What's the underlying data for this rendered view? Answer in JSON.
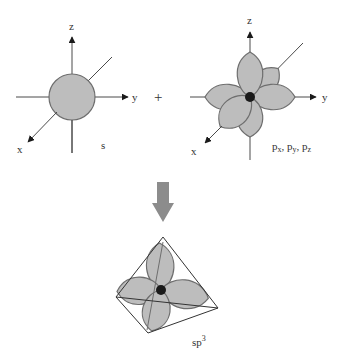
{
  "colors": {
    "orbital_fill": "#bdbdbd",
    "orbital_stroke": "#6e6e6e",
    "axis": "#4a4a4a",
    "nucleus": "#1a1a1a",
    "arrow_fill": "#8c8c8c",
    "tetra_stroke": "#333333"
  },
  "s_panel": {
    "axis_labels": {
      "z": "z",
      "y": "y",
      "x": "x"
    },
    "caption": "s"
  },
  "plus_sign": "+",
  "p_panel": {
    "axis_labels": {
      "z": "z",
      "y": "y",
      "x": "x"
    },
    "caption": {
      "p1": "p",
      "s1": "x",
      "sep1": ", ",
      "p2": "p",
      "s2": "y",
      "sep2": ", ",
      "p3": "p",
      "s3": "z"
    }
  },
  "arrow": {
    "direction": "down"
  },
  "sp3_panel": {
    "caption": {
      "base": "sp",
      "sup": "3"
    }
  }
}
